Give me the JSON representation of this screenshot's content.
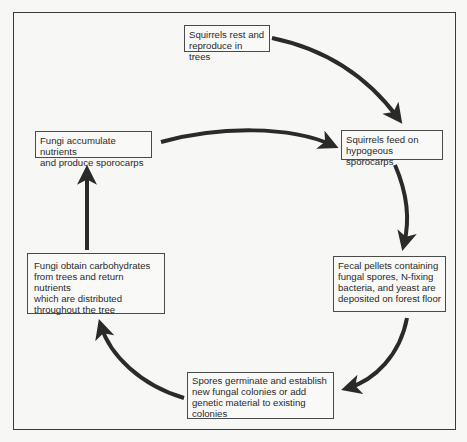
{
  "diagram": {
    "type": "cycle",
    "title": "",
    "nodes": [
      {
        "id": "n1",
        "label": "Squirrels rest and\nreproduce in trees"
      },
      {
        "id": "n2",
        "label": "Squirrels feed on\nhypogeous sporocarps"
      },
      {
        "id": "n3",
        "label": "Fecal pellets containing\nfungal spores, N-fixing\nbacteria, and yeast are\ndeposited on forest floor"
      },
      {
        "id": "n4",
        "label": "Spores germinate and establish\nnew fungal colonies or add\ngenetic material to existing\ncolonies"
      },
      {
        "id": "n5",
        "label": "Fungi obtain carbohydrates\nfrom trees and return nutrients\nwhich are distributed\nthroughout the tree"
      },
      {
        "id": "n6",
        "label": "Fungi accumulate nutrients\nand produce sporocarps"
      }
    ],
    "edges": [
      {
        "from": "n1",
        "to": "n2"
      },
      {
        "from": "n2",
        "to": "n3"
      },
      {
        "from": "n3",
        "to": "n4"
      },
      {
        "from": "n4",
        "to": "n5"
      },
      {
        "from": "n5",
        "to": "n6"
      },
      {
        "from": "n6",
        "to": "n2"
      }
    ],
    "colors": {
      "background": "#f7f7f5",
      "line": "#2a2a2a",
      "text": "#2a2a2a"
    }
  }
}
